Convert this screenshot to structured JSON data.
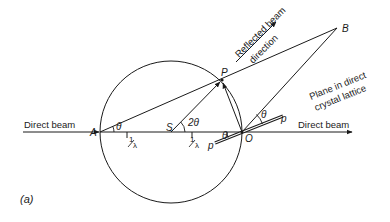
{
  "diagram": {
    "type": "Ewald sphere construction",
    "labels": {
      "direct_beam_left": "Direct beam",
      "direct_beam_right": "Direct beam",
      "reflected_line1": "Reflected beam",
      "reflected_line2": "direction",
      "plane_line1": "Plane in direct",
      "plane_line2": "crystal lattice",
      "point_A": "A",
      "point_S": "S",
      "point_O": "O",
      "point_P": "P",
      "point_B": "B",
      "plane_p_left": "p",
      "plane_p_right": "p",
      "theta_A": "θ",
      "two_theta_S": "2θ",
      "theta_O": "θ",
      "theta_p": "θ",
      "inv_lambda_1_num": "1",
      "inv_lambda_1_den": "λ",
      "inv_lambda_2_num": "1",
      "inv_lambda_2_den": "λ",
      "caption": "(a)"
    },
    "colors": {
      "line": "#1a1a1a",
      "background": "#ffffff"
    }
  }
}
